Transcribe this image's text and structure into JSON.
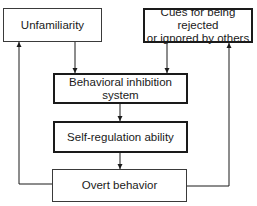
{
  "diagram": {
    "nodes": [
      {
        "id": "unfamiliarity",
        "label": "Unfamiliarity"
      },
      {
        "id": "cues",
        "label_line1": "Cues for being rejected",
        "label_line2": "or ignored by others"
      },
      {
        "id": "bis",
        "label": "Behavioral inhibition system"
      },
      {
        "id": "self_regulation",
        "label": "Self-regulation ability"
      },
      {
        "id": "overt_behavior",
        "label": "Overt behavior"
      }
    ],
    "edges": [
      {
        "from": "unfamiliarity",
        "to": "bis"
      },
      {
        "from": "cues",
        "to": "bis"
      },
      {
        "from": "bis",
        "to": "self_regulation"
      },
      {
        "from": "self_regulation",
        "to": "overt_behavior"
      },
      {
        "from": "overt_behavior",
        "to": "unfamiliarity"
      },
      {
        "from": "overt_behavior",
        "to": "cues"
      }
    ]
  }
}
